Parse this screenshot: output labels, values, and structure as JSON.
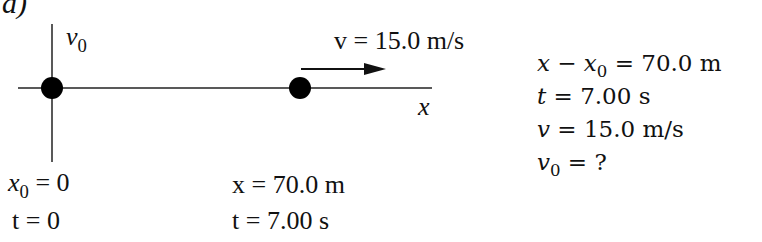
{
  "panel_label": "a)",
  "diagram": {
    "initial_velocity_label": {
      "symbol": "v",
      "subscript": "0"
    },
    "final_velocity_label": "v = 15.0 m/s",
    "axis_label": "x",
    "start_point": {
      "position_label": {
        "symbol": "x",
        "subscript": "0",
        "rest": "= 0"
      },
      "time_label": "t =  0"
    },
    "end_point": {
      "position_label": "x = 70.0 m",
      "time_label": "t = 7.00 s"
    }
  },
  "knowns": {
    "lines": [
      {
        "lhs": "x − x",
        "lhs_sub": "0",
        "rhs": " = 70.0 m"
      },
      {
        "lhs": "t",
        "lhs_sub": "",
        "rhs": " = 7.00 s"
      },
      {
        "lhs": "v",
        "lhs_sub": "",
        "rhs": " = 15.0 m/s"
      },
      {
        "lhs": "v",
        "lhs_sub": "0",
        "rhs": " = ?"
      }
    ]
  },
  "colors": {
    "ink": "#111111",
    "background": "#ffffff"
  }
}
